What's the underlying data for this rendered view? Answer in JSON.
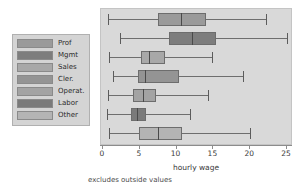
{
  "chart_data": {
    "type": "box",
    "title": "",
    "xlabel": "hourly wage",
    "ylabel": "",
    "xlim": [
      0,
      25
    ],
    "xticks": [
      0,
      5,
      10,
      15,
      20,
      25
    ],
    "xticklabels": [
      "0",
      "5",
      "10",
      "15",
      "20",
      "25"
    ],
    "grid": false,
    "legend_position": "left-outside",
    "footnote": "excludes outside values",
    "categories": [
      "Prof",
      "Mgmt",
      "Sales",
      "Cler.",
      "Operat.",
      "Labor",
      "Other"
    ],
    "boxes": [
      {
        "name": "Prof",
        "color": "#9a9a9a",
        "lower_whisker": 0.7,
        "q1": 7.5,
        "median": 10.6,
        "q3": 14.0,
        "upper_whisker": 22.2
      },
      {
        "name": "Mgmt",
        "color": "#7d7d7d",
        "lower_whisker": 2.3,
        "q1": 9.0,
        "median": 12.1,
        "q3": 15.3,
        "upper_whisker": 25.0
      },
      {
        "name": "Sales",
        "color": "#a8a8a8",
        "lower_whisker": 0.8,
        "q1": 5.2,
        "median": 6.3,
        "q3": 8.4,
        "upper_whisker": 14.8
      },
      {
        "name": "Cler.",
        "color": "#949494",
        "lower_whisker": 1.4,
        "q1": 4.8,
        "median": 5.7,
        "q3": 10.3,
        "upper_whisker": 19.0
      },
      {
        "name": "Operat.",
        "color": "#a3a3a3",
        "lower_whisker": 0.7,
        "q1": 4.1,
        "median": 5.4,
        "q3": 7.2,
        "upper_whisker": 14.3
      },
      {
        "name": "Labor",
        "color": "#7a7a7a",
        "lower_whisker": 0.5,
        "q1": 3.8,
        "median": 4.6,
        "q3": 5.8,
        "upper_whisker": 11.8
      },
      {
        "name": "Other",
        "color": "#b4b4b4",
        "lower_whisker": 0.8,
        "q1": 4.9,
        "median": 7.5,
        "q3": 10.7,
        "upper_whisker": 20.0
      }
    ]
  },
  "legend": {
    "items": [
      {
        "label": "Prof",
        "color": "#9a9a9a"
      },
      {
        "label": "Mgmt",
        "color": "#7d7d7d"
      },
      {
        "label": "Sales",
        "color": "#a8a8a8"
      },
      {
        "label": "Cler.",
        "color": "#949494"
      },
      {
        "label": "Operat.",
        "color": "#a3a3a3"
      },
      {
        "label": "Labor",
        "color": "#7a7a7a"
      },
      {
        "label": "Other",
        "color": "#b4b4b4"
      }
    ]
  },
  "colors": {
    "plot_background": "#d9d9d9",
    "legend_background": "#d4d4d4",
    "page_background": "#ffffff",
    "line": "#6e6e6e",
    "text": "#3a3a3a"
  }
}
